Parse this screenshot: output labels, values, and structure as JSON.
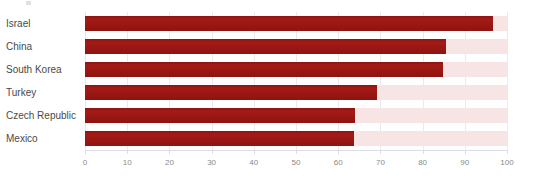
{
  "chart_data": {
    "type": "bar",
    "orientation": "horizontal",
    "title": "",
    "subtitle": "",
    "xlabel": "",
    "ylabel": "",
    "xlim": [
      0,
      100
    ],
    "grid": true,
    "legend": false,
    "bar_color": "#9d1714",
    "track_color": "#f7e4e4",
    "gridline_color": "#e9e9ee",
    "xticks": [
      0,
      10,
      20,
      30,
      40,
      50,
      60,
      70,
      80,
      90,
      100
    ],
    "xtick_labels": [
      "0",
      "10",
      "20",
      "30",
      "40",
      "50",
      "60",
      "70",
      "80",
      "90",
      "100"
    ],
    "categories": [
      "Israel",
      "China",
      "South Korea",
      "Turkey",
      "Czech Republic",
      "Mexico"
    ],
    "values": [
      96.7,
      85.5,
      84.8,
      69.2,
      64.0,
      63.7
    ],
    "points": [
      {
        "category": "Israel",
        "value": 96.7
      },
      {
        "category": "China",
        "value": 85.5
      },
      {
        "category": "South Korea",
        "value": 84.8
      },
      {
        "category": "Turkey",
        "value": 69.2
      },
      {
        "category": "Czech Republic",
        "value": 64.0
      },
      {
        "category": "Mexico",
        "value": 63.7
      }
    ]
  }
}
